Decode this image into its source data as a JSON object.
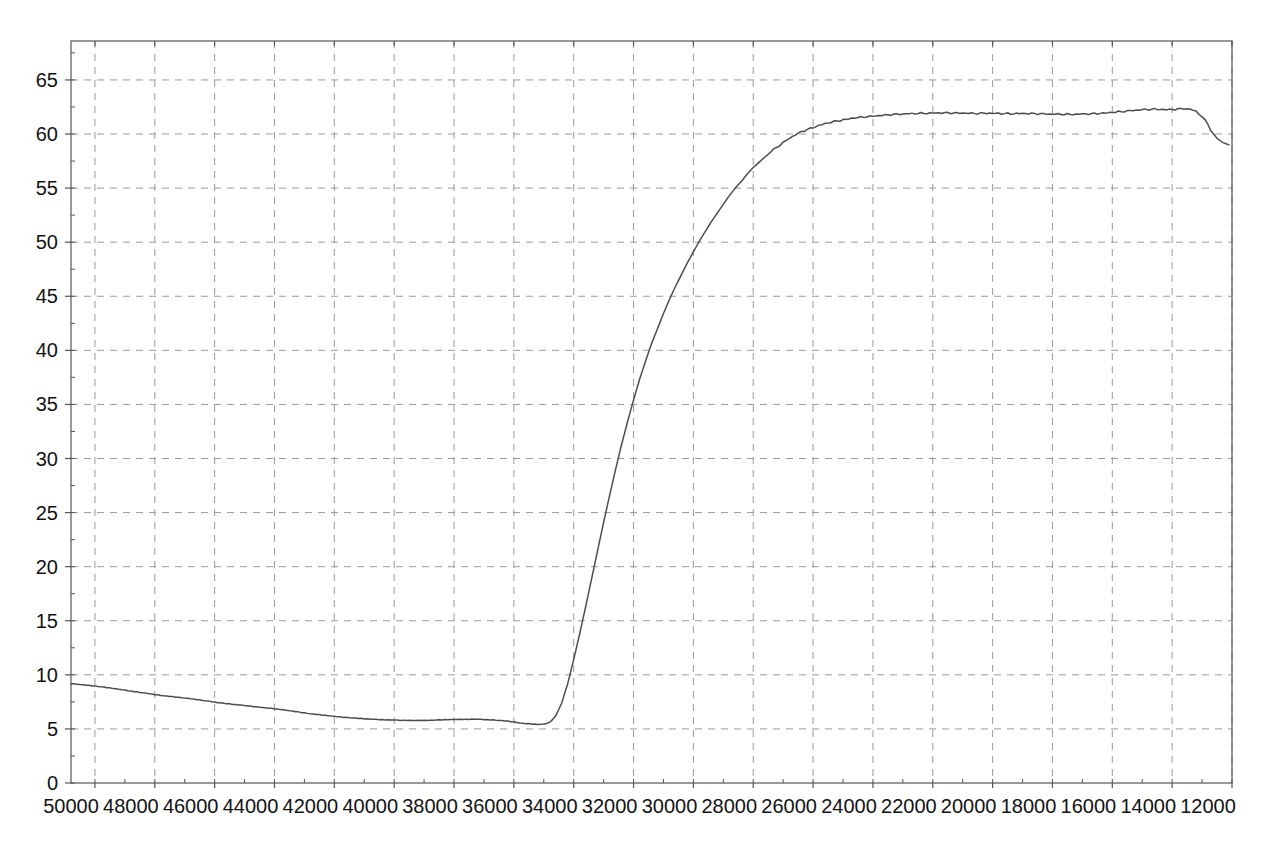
{
  "chart_data": {
    "type": "line",
    "title": "",
    "subtitle": "",
    "xlabel": "",
    "ylabel": "",
    "grid": true,
    "legend": "none",
    "x_axis": {
      "min": 11200,
      "max": 50000,
      "reversed": true,
      "tick_step": 2000,
      "minor_tick_step": 1000,
      "tick_labels": [
        "50000",
        "48000",
        "46000",
        "44000",
        "42000",
        "40000",
        "38000",
        "36000",
        "34000",
        "32000",
        "30000",
        "28000",
        "26000",
        "24000",
        "22000",
        "20000",
        "18000",
        "16000",
        "14000",
        "12000"
      ],
      "tick_values": [
        50000,
        48000,
        46000,
        44000,
        42000,
        40000,
        38000,
        36000,
        34000,
        32000,
        30000,
        28000,
        26000,
        24000,
        22000,
        20000,
        18000,
        16000,
        14000,
        12000
      ]
    },
    "y_axis": {
      "min": 0,
      "max": 68.6,
      "tick_step": 5,
      "minor_tick_step": 2.5,
      "tick_labels": [
        "0",
        "5",
        "10",
        "15",
        "20",
        "25",
        "30",
        "35",
        "40",
        "45",
        "50",
        "55",
        "60",
        "65"
      ],
      "tick_values": [
        0,
        5,
        10,
        15,
        20,
        25,
        30,
        35,
        40,
        45,
        50,
        55,
        60,
        65
      ]
    },
    "line_color": "#4d4d4d",
    "grid_color": "#9a9a9a",
    "axis_color": "#555555",
    "background_color": "#ffffff",
    "series": [
      {
        "name": "curve",
        "x": [
          50000,
          49500,
          49000,
          48500,
          48000,
          47500,
          47000,
          46500,
          46000,
          45500,
          45000,
          44500,
          44000,
          43500,
          43000,
          42500,
          42000,
          41500,
          41000,
          40500,
          40000,
          39500,
          39000,
          38500,
          38000,
          37500,
          37000,
          36500,
          36000,
          35500,
          35200,
          35000,
          34800,
          34600,
          34400,
          34200,
          34000,
          33800,
          33600,
          33400,
          33200,
          33000,
          32800,
          32600,
          32400,
          32200,
          32000,
          31800,
          31600,
          31400,
          31200,
          31000,
          30800,
          30600,
          30400,
          30200,
          30000,
          29800,
          29600,
          29400,
          29200,
          29000,
          28800,
          28600,
          28400,
          28200,
          28000,
          27800,
          27600,
          27400,
          27200,
          27000,
          26800,
          26600,
          26400,
          26200,
          26000,
          25800,
          25600,
          25400,
          25200,
          25000,
          24600,
          24200,
          23800,
          23400,
          23000,
          22600,
          22200,
          21800,
          21400,
          21000,
          20600,
          20200,
          19800,
          19400,
          19000,
          18600,
          18200,
          17800,
          17400,
          17000,
          16600,
          16200,
          15800,
          15400,
          15000,
          14600,
          14200,
          13800,
          13400,
          13000,
          12800,
          12600,
          12400,
          12200,
          12000,
          11900,
          11800,
          11700,
          11600,
          11500,
          11400,
          11300
        ],
        "y": [
          9.2,
          9.05,
          8.9,
          8.7,
          8.5,
          8.3,
          8.1,
          7.95,
          7.8,
          7.6,
          7.4,
          7.25,
          7.1,
          6.95,
          6.8,
          6.6,
          6.4,
          6.25,
          6.1,
          6.0,
          5.9,
          5.85,
          5.8,
          5.78,
          5.8,
          5.85,
          5.88,
          5.9,
          5.85,
          5.75,
          5.65,
          5.55,
          5.5,
          5.45,
          5.42,
          5.45,
          5.6,
          6.2,
          7.4,
          9.2,
          11.4,
          13.8,
          16.3,
          18.9,
          21.5,
          24.1,
          26.6,
          29.0,
          31.3,
          33.4,
          35.4,
          37.3,
          39.0,
          40.6,
          42.0,
          43.4,
          44.7,
          45.9,
          47.0,
          48.1,
          49.1,
          50.1,
          51.0,
          51.9,
          52.7,
          53.5,
          54.3,
          55.0,
          55.6,
          56.3,
          56.9,
          57.4,
          57.9,
          58.4,
          58.8,
          59.2,
          59.6,
          59.9,
          60.2,
          60.4,
          60.6,
          60.8,
          61.1,
          61.3,
          61.5,
          61.6,
          61.7,
          61.8,
          61.85,
          61.9,
          61.92,
          61.95,
          61.95,
          61.93,
          61.9,
          61.92,
          61.9,
          61.88,
          61.9,
          61.88,
          61.85,
          61.83,
          61.82,
          61.85,
          61.88,
          61.95,
          62.05,
          62.15,
          62.25,
          62.3,
          62.25,
          62.3,
          62.35,
          62.3,
          62.1,
          61.6,
          60.9,
          60.3,
          59.9,
          59.6,
          59.4,
          59.2,
          59.1,
          59.0
        ]
      }
    ]
  },
  "plot_geometry": {
    "left": 71,
    "right": 1232,
    "top": 41,
    "bottom": 783
  }
}
